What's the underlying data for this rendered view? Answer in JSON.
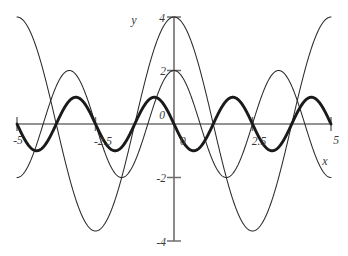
{
  "chart_data": {
    "type": "line",
    "title": "",
    "xlabel": "x",
    "ylabel": "y",
    "xlim": [
      -5,
      5
    ],
    "ylim": [
      -4,
      4
    ],
    "grid": false,
    "legend": "none",
    "x_ticks": [
      {
        "value": -5,
        "label": "-5"
      },
      {
        "value": -2.5,
        "label": "-2.5"
      },
      {
        "value": 0,
        "label": "0"
      },
      {
        "value": 2.5,
        "label": "2.5"
      },
      {
        "value": 5,
        "label": "5"
      }
    ],
    "y_ticks": [
      {
        "value": 4,
        "label": "4"
      },
      {
        "value": 2,
        "label": "2"
      },
      {
        "value": 0,
        "label": "0"
      },
      {
        "value": -2,
        "label": "-2"
      },
      {
        "value": -4,
        "label": "-4"
      }
    ],
    "series": [
      {
        "name": "large-amplitude-wave",
        "style": "thin",
        "amplitude": 4,
        "period": 5.0,
        "phase": 0,
        "form": "4*sin(2*pi*x/5 + pi/2)",
        "description": "thin sinusoid with amplitude 4 and period 5, peaks near x = -3.75, 1.25 and zero crossings near x = -5, -2.5, 0, 2.5, 5"
      },
      {
        "name": "medium-amplitude-wave",
        "style": "thin",
        "amplitude": 2,
        "period": 3.333,
        "phase": 0,
        "form": "2*sin(2*pi*x/3.333 + pi/2)",
        "description": "thin sinusoid with amplitude 2 and period 3.33, peaks near x = -3.33, 0, 3.33"
      },
      {
        "name": "small-amplitude-wave",
        "style": "bold",
        "amplitude": 1,
        "period": 2.5,
        "phase": 0,
        "form": "sin(2*pi*x/2.5 + pi)",
        "description": "bold sinusoid with amplitude 1 and period 2.5, troughs near x = -4.4, -1.9, 0.6, 3.1"
      }
    ]
  },
  "labels": {
    "y_axis_name": "y",
    "x_axis_name": "x",
    "origin_y_label": "0",
    "origin_x_label": "0"
  }
}
